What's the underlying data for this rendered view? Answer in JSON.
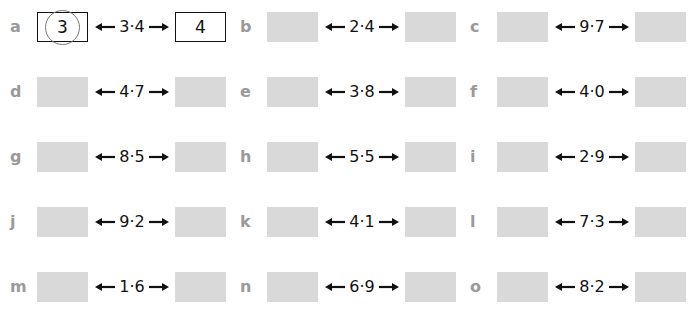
{
  "exercise": {
    "items": [
      {
        "letter": "a",
        "value": "3·4",
        "lower": "3",
        "upper": "4",
        "answered": true,
        "circled": "lower"
      },
      {
        "letter": "b",
        "value": "2·4",
        "lower": "",
        "upper": "",
        "answered": false
      },
      {
        "letter": "c",
        "value": "9·7",
        "lower": "",
        "upper": "",
        "answered": false
      },
      {
        "letter": "d",
        "value": "4·7",
        "lower": "",
        "upper": "",
        "answered": false
      },
      {
        "letter": "e",
        "value": "3·8",
        "lower": "",
        "upper": "",
        "answered": false
      },
      {
        "letter": "f",
        "value": "4·0",
        "lower": "",
        "upper": "",
        "answered": false
      },
      {
        "letter": "g",
        "value": "8·5",
        "lower": "",
        "upper": "",
        "answered": false
      },
      {
        "letter": "h",
        "value": "5·5",
        "lower": "",
        "upper": "",
        "answered": false
      },
      {
        "letter": "i",
        "value": "2·9",
        "lower": "",
        "upper": "",
        "answered": false
      },
      {
        "letter": "j",
        "value": "9·2",
        "lower": "",
        "upper": "",
        "answered": false
      },
      {
        "letter": "k",
        "value": "4·1",
        "lower": "",
        "upper": "",
        "answered": false
      },
      {
        "letter": "l",
        "value": "7·3",
        "lower": "",
        "upper": "",
        "answered": false
      },
      {
        "letter": "m",
        "value": "1·6",
        "lower": "",
        "upper": "",
        "answered": false
      },
      {
        "letter": "n",
        "value": "6·9",
        "lower": "",
        "upper": "",
        "answered": false
      },
      {
        "letter": "o",
        "value": "8·2",
        "lower": "",
        "upper": "",
        "answered": false
      }
    ]
  },
  "colors": {
    "label": "#9a9a9a",
    "empty_box": "#d9d9d9",
    "text": "#111111",
    "circle": "#777777"
  }
}
